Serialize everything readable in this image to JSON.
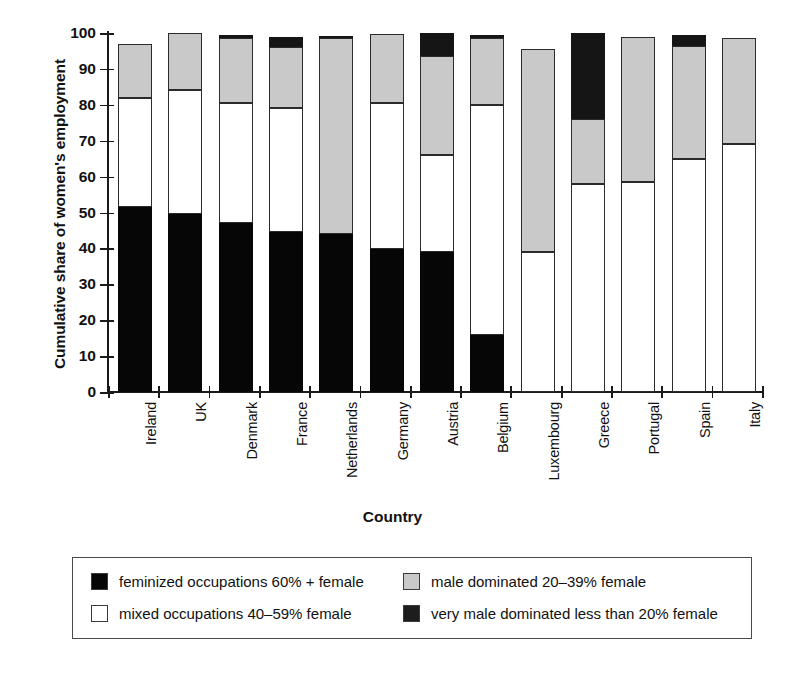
{
  "chart_data": {
    "type": "bar",
    "subtype": "stacked-vertical",
    "title": "",
    "xlabel": "Country",
    "ylabel": "Cumulative share of women's employment",
    "ylim": [
      0,
      100
    ],
    "yticks": [
      0,
      10,
      20,
      30,
      40,
      50,
      60,
      70,
      80,
      90,
      100
    ],
    "grid": false,
    "legend_position": "below-plot",
    "categories": [
      "Ireland",
      "UK",
      "Denmark",
      "France",
      "Netherlands",
      "Germany",
      "Austria",
      "Belgium",
      "Luxembourg",
      "Greece",
      "Portugal",
      "Spain",
      "Italy"
    ],
    "series": [
      {
        "name": "feminized occupations 60% + female",
        "color": "#060606",
        "values": [
          51.5,
          49.5,
          47.0,
          44.5,
          44.0,
          39.7,
          39.0,
          16.0,
          0,
          0,
          0,
          0,
          0
        ]
      },
      {
        "name": "mixed occupations 40–59% female",
        "color": "#ffffff",
        "values": [
          30.5,
          34.5,
          33.5,
          34.5,
          0,
          40.8,
          27.0,
          64.0,
          39.0,
          58.0,
          58.5,
          65.0,
          69.0
        ]
      },
      {
        "name": "male dominated 20–39% female",
        "color": "#c9c9c9",
        "values": [
          15.0,
          16.0,
          18.0,
          17.0,
          54.5,
          19.3,
          27.5,
          18.5,
          56.5,
          18.0,
          40.5,
          31.5,
          29.5
        ]
      },
      {
        "name": "very male dominated less than 20% female",
        "color": "#1d1d1d",
        "values": [
          0,
          0,
          1.0,
          3.0,
          0.8,
          0,
          6.5,
          1.0,
          0,
          24.0,
          0,
          3.0,
          0
        ]
      }
    ],
    "cumulative_tops": {
      "Ireland": [
        51.5,
        82.0,
        97.0,
        97.0
      ],
      "UK": [
        49.5,
        84.0,
        100.0,
        100.0
      ],
      "Denmark": [
        47.0,
        80.5,
        98.5,
        99.5
      ],
      "France": [
        44.5,
        79.0,
        96.0,
        99.0
      ],
      "Netherlands": [
        44.0,
        44.0,
        98.5,
        99.3
      ],
      "Germany": [
        39.7,
        80.5,
        99.8,
        99.8
      ],
      "Austria": [
        39.0,
        66.0,
        93.5,
        100.0
      ],
      "Belgium": [
        16.0,
        80.0,
        98.5,
        99.5
      ],
      "Luxembourg": [
        0.0,
        39.0,
        95.5,
        95.5
      ],
      "Greece": [
        0.0,
        58.0,
        76.0,
        100.0
      ],
      "Portugal": [
        0.0,
        58.5,
        99.0,
        99.0
      ],
      "Spain": [
        0.0,
        65.0,
        96.5,
        99.5
      ],
      "Italy": [
        0.0,
        69.0,
        98.5,
        98.5
      ]
    }
  },
  "axis": {
    "y_title": "Cumulative share of women's employment",
    "x_title": "Country",
    "y_tick_labels": [
      "0",
      "10",
      "20",
      "30",
      "40",
      "50",
      "60",
      "70",
      "80",
      "90",
      "100"
    ]
  },
  "legend": {
    "items": [
      {
        "label": "feminized occupations 60% + female",
        "swatch": "black-square-swatch"
      },
      {
        "label": "mixed occupations 40–59% female",
        "swatch": "white-square-swatch"
      },
      {
        "label": "male dominated 20–39% female",
        "swatch": "grey-square-swatch"
      },
      {
        "label": "very male dominated less than 20% female",
        "swatch": "dark-square-swatch"
      }
    ]
  },
  "colors": {
    "feminized": "#060606",
    "mixed": "#ffffff",
    "male_dominated": "#c9c9c9",
    "very_male_dominated": "#1d1d1d",
    "axis": "#1a1a1a",
    "background": "#ffffff"
  }
}
